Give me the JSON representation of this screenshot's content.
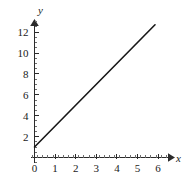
{
  "chart_data": {
    "type": "line",
    "title": "",
    "subtitle": "",
    "xlabel": "x",
    "ylabel": "y",
    "xlim": [
      -0.35,
      6.6
    ],
    "ylim": [
      -0.85,
      13.6
    ],
    "grid": false,
    "legend": null,
    "x_ticks": [
      0,
      1,
      2,
      3,
      4,
      5,
      6
    ],
    "x_tick_labels": [
      "0",
      "1",
      "2",
      "3",
      "4",
      "5",
      "6"
    ],
    "x_minor_step": 0.25,
    "y_ticks": [
      2,
      4,
      6,
      8,
      10,
      12
    ],
    "y_tick_labels": [
      "2",
      "4",
      "6",
      "8",
      "10",
      "12"
    ],
    "y_minor_step": 0.5,
    "axis_arrows": true,
    "series": [
      {
        "name": "y = 2x + 1",
        "type": "line",
        "color": "#171717",
        "slope": 2,
        "intercept": 1,
        "x": [
          0,
          5.85
        ],
        "values": [
          1,
          12.7
        ],
        "points": [
          [
            0,
            1
          ],
          [
            5.85,
            12.7
          ]
        ]
      }
    ]
  },
  "axes": {
    "x_axis_name": "x",
    "y_axis_name": "y"
  }
}
